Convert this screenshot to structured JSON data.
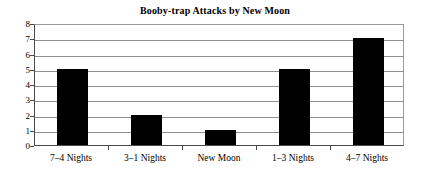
{
  "chart_data": {
    "type": "bar",
    "title": "Booby-trap Attacks by New Moon",
    "xlabel": "",
    "ylabel": "",
    "categories": [
      "7–4 Nights",
      "3–1 Nights",
      "New Moon",
      "1–3 Nights",
      "4–7 Nights"
    ],
    "values": [
      5,
      2,
      1,
      5,
      7
    ],
    "ylim": [
      0,
      8
    ],
    "ytick_labels": [
      "0",
      "1",
      "2",
      "3",
      "4",
      "5",
      "6",
      "7",
      "8"
    ],
    "ytick_values": [
      0,
      1,
      2,
      3,
      4,
      5,
      6,
      7,
      8
    ],
    "grid": true,
    "grid_axis": "y",
    "legend": false,
    "bar_color": "#000000",
    "grid_color": "#8f8f8f",
    "axis_color": "#4a4a4a",
    "background_color": "#ffffff"
  }
}
